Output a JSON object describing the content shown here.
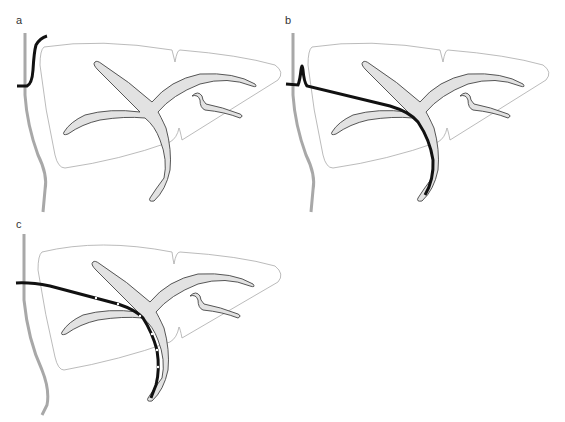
{
  "figure": {
    "panels": [
      {
        "id": "a",
        "label": "a",
        "description": "Guidewire hooked at entry, liver outline with biliary tree"
      },
      {
        "id": "b",
        "label": "b",
        "description": "Guidewire advanced through left hepatic duct into common bile duct"
      },
      {
        "id": "c",
        "label": "c",
        "description": "Drainage catheter with side holes placed along guidewire track"
      }
    ],
    "colors": {
      "outline": "#9a9a9a",
      "duct_fill": "#e2e2e2",
      "duct_stroke": "#444444",
      "wire": "#111111",
      "body_wall": "#a8a8a8"
    }
  }
}
